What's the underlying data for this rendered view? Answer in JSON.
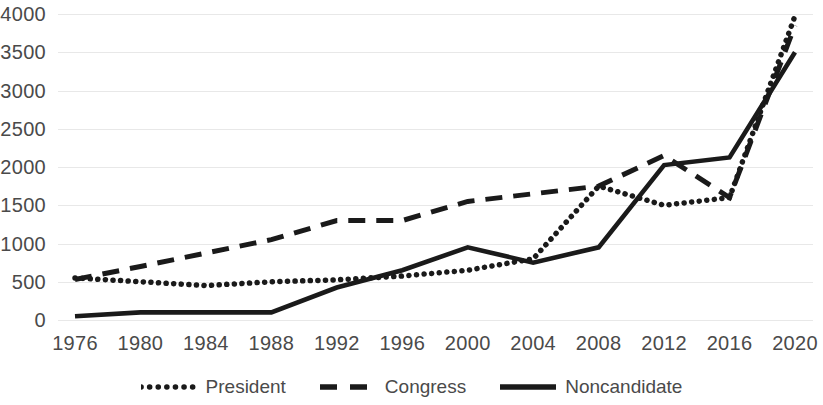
{
  "chart_data": {
    "type": "line",
    "title": "",
    "subtitle": "",
    "xlabel": "",
    "ylabel": "",
    "x": [
      1976,
      1980,
      1984,
      1988,
      1992,
      1996,
      2000,
      2004,
      2008,
      2012,
      2016,
      2020
    ],
    "xtick_labels": [
      "1976",
      "1980",
      "1984",
      "1988",
      "1992",
      "1996",
      "2000",
      "2004",
      "2008",
      "2012",
      "2016",
      "2020"
    ],
    "ytick_labels": [
      "4000",
      "3500",
      "3000",
      "2500",
      "2000",
      "1500",
      "1000",
      "500",
      "0"
    ],
    "ytick_values": [
      4000,
      3500,
      3000,
      2500,
      2000,
      1500,
      1000,
      500,
      0
    ],
    "xlim": [
      1976,
      2020
    ],
    "ylim": [
      0,
      4000
    ],
    "grid": "horizontal",
    "legend_position": "bottom",
    "series": [
      {
        "name": "President",
        "style": "dotted",
        "color": "#1a1a1a",
        "values": [
          550,
          500,
          450,
          500,
          525,
          575,
          650,
          800,
          1750,
          1500,
          1600,
          3975
        ]
      },
      {
        "name": "Congress",
        "style": "dashed",
        "color": "#1a1a1a",
        "values": [
          530,
          700,
          875,
          1050,
          1300,
          1300,
          1550,
          1650,
          1750,
          2150,
          1600,
          3850
        ]
      },
      {
        "name": "Noncandidate",
        "style": "solid",
        "color": "#1a1a1a",
        "values": [
          50,
          100,
          100,
          100,
          425,
          650,
          950,
          750,
          950,
          2025,
          2125,
          3500
        ]
      }
    ],
    "gridline_color": "#e8e8e8",
    "tick_label_color": "#4a4a4a"
  },
  "legend": {
    "items": [
      {
        "label": "President",
        "style": "dotted"
      },
      {
        "label": "Congress",
        "style": "dashed"
      },
      {
        "label": "Noncandidate",
        "style": "solid"
      }
    ]
  }
}
